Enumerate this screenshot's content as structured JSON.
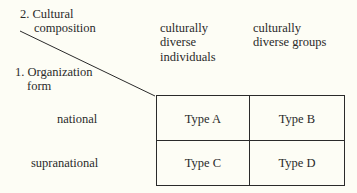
{
  "axis_labels": {
    "cultural_composition": [
      "2. Cultural",
      "composition"
    ],
    "organization_form": [
      "1. Organization",
      "form"
    ]
  },
  "columns": [
    {
      "lines": [
        "culturally",
        "diverse",
        "individuals"
      ]
    },
    {
      "lines": [
        "culturally",
        "diverse groups"
      ]
    }
  ],
  "rows": [
    {
      "label": "national"
    },
    {
      "label": "supranational"
    }
  ],
  "cells": [
    [
      "Type A",
      "Type B"
    ],
    [
      "Type C",
      "Type D"
    ]
  ],
  "colors": {
    "background": "#fdfdf5",
    "line": "#2a2a2a",
    "text": "#2a2a2a"
  }
}
